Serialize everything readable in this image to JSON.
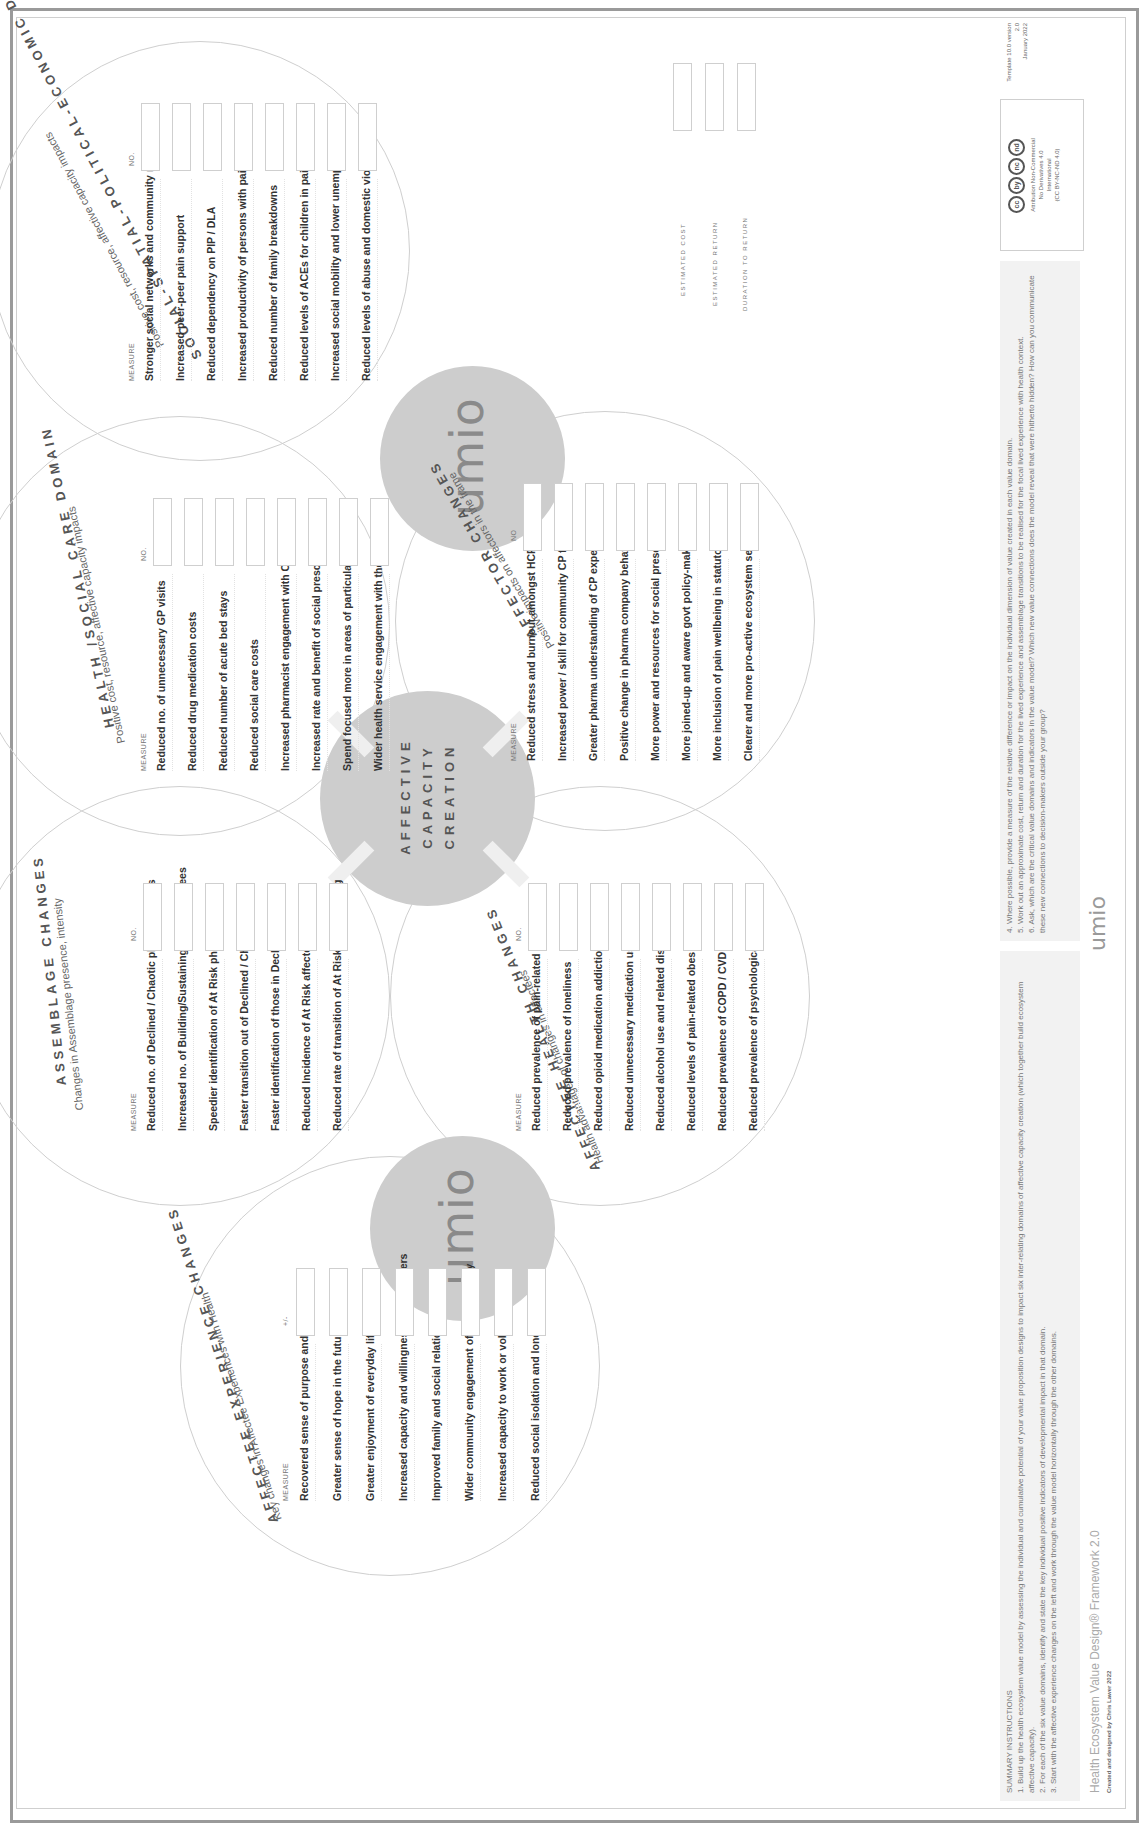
{
  "center": {
    "label_lines": [
      "AFFECTIVE",
      "CAPACITY",
      "CREATION"
    ],
    "logo_text": "umio"
  },
  "columns": {
    "measure": "MEASURE",
    "no": "NO.",
    "plus_minus": "+/-"
  },
  "domains": {
    "affectee_experience": {
      "title": "AFFECTEE EXPERIENCE CHANGES",
      "subtitle": "Key changes in Affectee Experiences with Health",
      "value_header": "+/-",
      "items": [
        "Recovered sense of purpose and identity",
        "Greater sense of hope in the future",
        "Greater enjoyment of everyday life",
        "Increased capacity and willingness to help others",
        "Improved family and social relations",
        "Wider community engagement of higher quality",
        "Increased capacity to work or volunteer",
        "Reduced social isolation and loneliness"
      ]
    },
    "assemblage": {
      "title": "ASSEMBLAGE CHANGES",
      "subtitle": "Changes in Assemblage presence, intensity",
      "value_header": "NO.",
      "items": [
        "Reduced no. of Declined / Chaotic phase affectees",
        "Increased no. of Building/Sustaining phase affectees",
        "Speedier identification of At Risk phase affectees",
        "Faster transition out of Declined / Chaotic Phase",
        "Faster identification of those in Declined /Chaotic",
        "Reduced Incidence of At Risk affectees",
        "Reduced rate of transition of At Risk to Worsening"
      ]
    },
    "health_social_care": {
      "title": "HEALTH /SOCIAL CARE DOMAIN",
      "subtitle": "Positive cost, resource, affective capacity impacts",
      "value_header": "NO.",
      "items": [
        "Reduced no. of unnecessary GP visits",
        "Reduced drug medication costs",
        "Reduced number of acute bed stays",
        "Reduced social care costs",
        "Increased pharmacist engagement with CP persons",
        "Increased rate and benefit of social prescribing",
        "Spend focused more in areas of particular need",
        "Wider health service engagement with the community"
      ]
    },
    "social_spatial": {
      "title": "SOCIAL-SPATIAL-POLITICAL-ECONOMIC DOMAIN",
      "subtitle": "Positive cost, resource, affective capacity impacts",
      "value_header": "NO.",
      "items": [
        "Stronger social networks and community relations",
        "Increased peer-peer pain support",
        "Reduced dependency on PIP / DLA",
        "Increased productivity of persons with pain",
        "Reduced number of family breakdowns",
        "Reduced levels of ACEs for children in pain families",
        "Increased social mobility and lower unemployment",
        "Reduced levels of abuse and domestic violence"
      ]
    },
    "affectee_health": {
      "title": "AFFECTEE HEALTH CHANGES",
      "subtitle": "Health advantages of changes in affectees",
      "value_header": "NO.",
      "items": [
        "Reduced prevalence of pain-related depression",
        "Reduced prevalence of loneliness",
        "Reduced opioid medication addiction",
        "Reduced unnecessary medication use",
        "Reduced alcohol use and related diseases",
        "Reduced levels of pain-related obesity",
        "Reduced prevalence of COPD / CVD",
        "Reduced prevalence of psychological trauma"
      ]
    },
    "affector": {
      "title": "AFFECTOR CHANGES",
      "subtitle": "Positive impacts on affectors in the frame",
      "value_header": "NO",
      "items": [
        "Reduced stress and burnout amongst HCPs",
        "Increased power / skill for community CP facilitators",
        "Greater pharma understanding of CP experience",
        "Positive change in pharma company behaviour",
        "More power and resources for social prescribers",
        "More joined-up and aware govt policy-making",
        "More inclusion of pain wellbeing in statutory plans",
        "Clearer and more pro-active ecosystem sense"
      ]
    }
  },
  "estimates": {
    "labels": [
      "ESTIMATED COST",
      "ESTIMATED RETURN",
      "DURATION TO RETURN"
    ]
  },
  "footer": {
    "instructions_title": "SUMMARY INSTRUCTIONS",
    "instructions_left": [
      {
        "num": "1.",
        "text": "Build up the health ecosystem value model by assessing the individual and cumulative potential of your value proposition designs to impact six inter-relating domains of affective capacity creation (which together build ecosystem affective capacity)."
      },
      {
        "num": "2.",
        "text": "For each of the six value domains, identify and state the key individual positive indicators of developmental impact in that domain."
      },
      {
        "num": "3.",
        "text": "Start with the affective experience changes on the left and work through the value model horizontally through the other domains."
      }
    ],
    "instructions_right": [
      {
        "num": "4.",
        "text": "Where possible, provide a measure of the relative difference or impact on the individual dimension of value created in each value domain."
      },
      {
        "num": "5.",
        "text": "Work out an approximate cost, return and duration for the lived experience and assemblage transitions to be realised for the focal lived experience with health context."
      },
      {
        "num": "6.",
        "text": "Ask, which are the critical value domains and indicators in the value model? Which new value connections does the model reveal that were hitherto hidden? How can you communicate these new connections to decision-makers outside your group?"
      }
    ],
    "brand_title": "Health Ecosystem Value Design® Framework 2.0",
    "brand_credit": "Created and designed by Chris Lawer 2022",
    "logo_text": "umio",
    "license": {
      "icons": [
        "cc",
        "by",
        "nc",
        "nd"
      ],
      "lines": [
        "Attribution Non-Commercial",
        "No Derivatives 4.0",
        "International",
        "(CC BY-NC-ND 4.0)"
      ]
    },
    "template_version": [
      "Template 10.0 version 2.0",
      "January 2022"
    ]
  }
}
